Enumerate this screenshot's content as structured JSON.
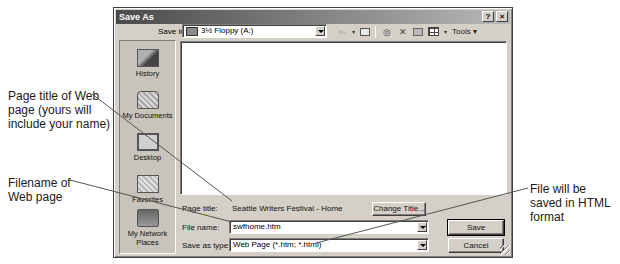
{
  "dialog": {
    "title": "Save As",
    "title_buttons": {
      "help": "?",
      "close": "×"
    },
    "save_in": {
      "label": "Save in:",
      "value": "3½ Floppy (A:)"
    },
    "toolbar": {
      "back_icon": "⇦",
      "dropdown_arrow": "▾",
      "tools_label": "Tools ▾"
    },
    "places": [
      {
        "label": "History",
        "icon": "history-icon"
      },
      {
        "label": "My Documents",
        "icon": "my-documents-icon"
      },
      {
        "label": "Desktop",
        "icon": "desktop-icon"
      },
      {
        "label": "Favorites",
        "icon": "favorites-icon"
      },
      {
        "label_line1": "My Network",
        "label_line2": "Places",
        "icon": "network-places-icon"
      }
    ],
    "page_title": {
      "label": "Page title:",
      "value": "Seattle Writers Festival - Home",
      "change_button": "Change Title..."
    },
    "file_name": {
      "label": "File name:",
      "value": "swfhome.htm"
    },
    "save_as_type": {
      "label": "Save as type:",
      "value": "Web Page (*.htm; *.html)"
    },
    "buttons": {
      "save": "Save",
      "cancel": "Cancel"
    }
  },
  "callouts": {
    "page_title": "Page title of Web page (yours will include your name)",
    "filename": "Filename of Web page",
    "html_format": "File will be saved in HTML format"
  }
}
